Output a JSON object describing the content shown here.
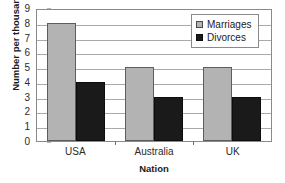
{
  "chart_data": {
    "type": "bar",
    "title": "",
    "xlabel": "Nation",
    "ylabel": "Number per thousand",
    "categories": [
      "USA",
      "Australia",
      "UK"
    ],
    "series": [
      {
        "name": "Marriages",
        "values": [
          8,
          5,
          5
        ],
        "color": "#b3b3b3"
      },
      {
        "name": "Divorces",
        "values": [
          4,
          3,
          3
        ],
        "color": "#1a1a1a"
      }
    ],
    "ylim": [
      0,
      9
    ],
    "ytick_step": 1,
    "yticks": [
      "9",
      "8",
      "7",
      "6",
      "5",
      "4",
      "3",
      "2",
      "1",
      "0"
    ],
    "grid": true,
    "grid_axis": "y",
    "legend_position": "top-right-inside",
    "orientation": "vertical",
    "grouping": "grouped"
  },
  "axes": {
    "y_title": "Number per thousand",
    "x_title": "Nation",
    "y_tick_labels": [
      "9",
      "8",
      "7",
      "6",
      "5",
      "4",
      "3",
      "2",
      "1",
      "0"
    ],
    "x_tick_labels": [
      "USA",
      "Australia",
      "UK"
    ]
  },
  "legend": {
    "items": [
      {
        "label": "Marriages",
        "swatch": "marriages-swatch"
      },
      {
        "label": "Divorces",
        "swatch": "divorces-swatch"
      }
    ]
  },
  "colors": {
    "marriages": "#b3b3b3",
    "divorces": "#1a1a1a",
    "gridline": "#a9a9a9",
    "frame": "#8a8a8a",
    "text": "#2b2b2b"
  }
}
